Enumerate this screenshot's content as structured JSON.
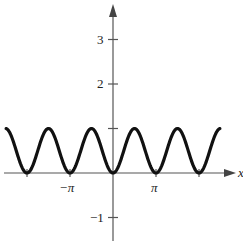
{
  "chart_data": {
    "type": "line",
    "title": "",
    "function": "y = sin^2(x)",
    "xlabel": "x",
    "ylabel": "",
    "xlim": [
      -7.86,
      7.86
    ],
    "ylim": [
      -1.5,
      3.8
    ],
    "grid": false,
    "legend": null,
    "x_ticks": [
      {
        "value": -3.14159,
        "label": "-π"
      },
      {
        "value": 3.14159,
        "label": "π"
      }
    ],
    "y_ticks": [
      {
        "value": 3,
        "label": "3"
      },
      {
        "value": 2,
        "label": "2"
      },
      {
        "value": 1,
        "label": ""
      },
      {
        "value": -1,
        "label": "-1"
      }
    ],
    "series": [
      {
        "name": "sin^2(x)",
        "x": [
          -7.85,
          -6.28,
          -4.71,
          -3.14,
          -1.57,
          0,
          1.57,
          3.14,
          4.71,
          6.28,
          7.85
        ],
        "values": [
          1,
          0,
          1,
          0,
          1,
          0,
          1,
          0,
          1,
          0,
          1
        ]
      }
    ]
  },
  "labels": {
    "y3": "3",
    "y2": "2",
    "yneg1": "−1",
    "xnegpi": "−π",
    "xpi": "π",
    "xaxis": "x"
  }
}
